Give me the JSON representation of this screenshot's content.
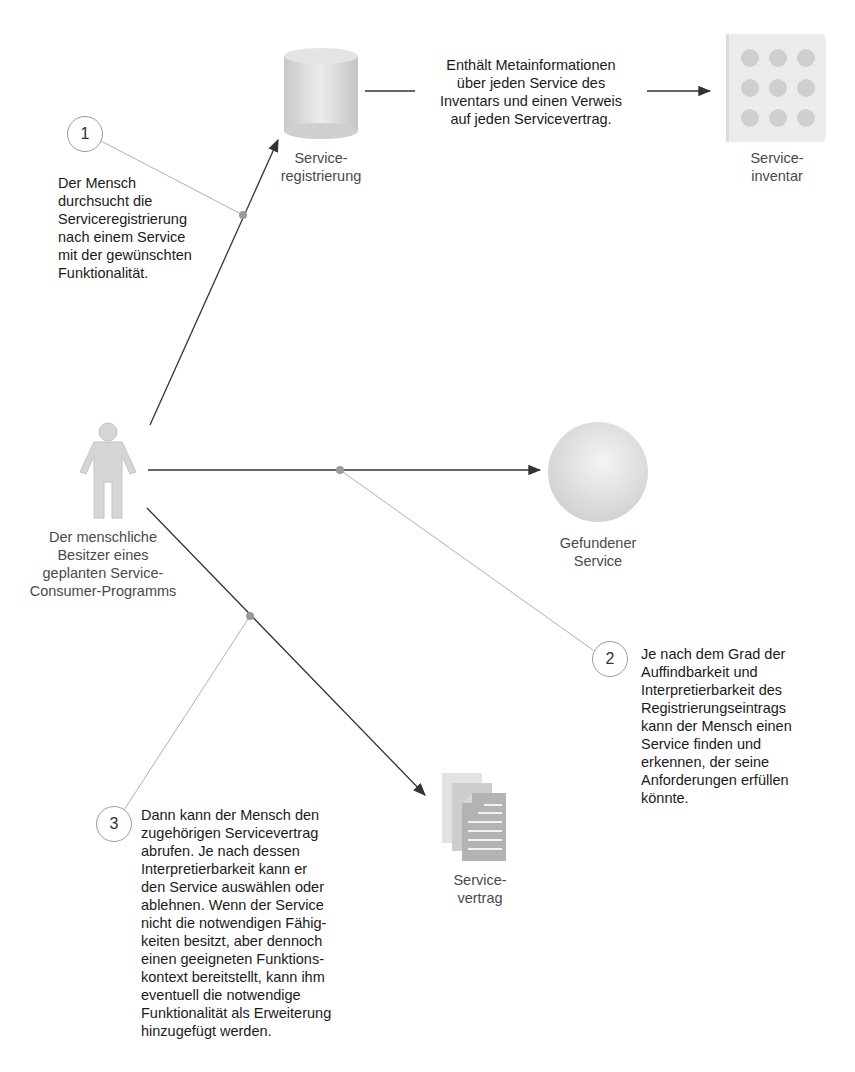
{
  "nodes": {
    "registry": {
      "label": [
        "Service-",
        "registrierung"
      ],
      "icon": "database-cylinder-icon"
    },
    "inventory": {
      "label": [
        "Service-",
        "inventar"
      ],
      "icon": "service-grid-icon"
    },
    "human": {
      "label": [
        "Der menschliche",
        "Besitzer eines",
        "geplanten Service-",
        "Consumer-Programms"
      ],
      "icon": "person-icon"
    },
    "found_service": {
      "label": [
        "Gefundener",
        "Service"
      ],
      "icon": "sphere-icon"
    },
    "contract": {
      "label": [
        "Service-",
        "vertrag"
      ],
      "icon": "documents-stack-icon"
    }
  },
  "registry_note": [
    "Enthält Metainformationen",
    "über jeden Service des",
    "Inventars und einen Verweis",
    "auf jeden Servicevertrag."
  ],
  "steps": [
    {
      "number": "1",
      "text": [
        "Der Mensch",
        "durchsucht die",
        "Serviceregistrierung",
        "nach einem Service",
        "mit der gewünschten",
        "Funktionalität."
      ]
    },
    {
      "number": "2",
      "text": [
        "Je nach dem Grad der",
        "Auffindbarkeit und",
        "Interpretierbarkeit des",
        "Registrierungseintrags",
        "kann der Mensch einen",
        "Service finden und",
        "erkennen, der seine",
        "Anforderungen erfüllen",
        "könnte."
      ]
    },
    {
      "number": "3",
      "text": [
        "Dann kann der Mensch den",
        "zugehörigen Servicevertrag",
        "abrufen. Je nach dessen",
        "Interpretierbarkeit kann er",
        "den Service auswählen oder",
        "ablehnen. Wenn der Service",
        "nicht die notwendigen Fähig-",
        "keiten besitzt, aber dennoch",
        "einen geeigneten Funktions-",
        "kontext bereitstellt, kann ihm",
        "eventuell die notwendige",
        "Funktionalität als Erweiterung",
        "hinzugefügt werden."
      ]
    }
  ],
  "colors": {
    "arrow": "#333333",
    "callout_line": "#b0b0b0",
    "joint_dot": "#9a9a9a",
    "icon_fill": "#d8d8d8"
  }
}
